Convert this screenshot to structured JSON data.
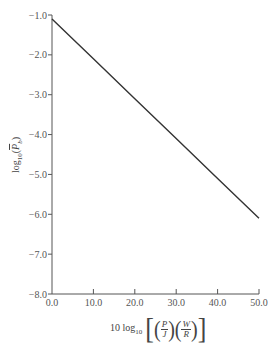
{
  "chart_data": {
    "type": "line",
    "title": "",
    "xlabel": "10 log10 [(P/J)(W/R)]",
    "ylabel": "log10(P̄b)",
    "xlim": [
      0,
      50
    ],
    "ylim": [
      -8,
      -1
    ],
    "grid": false,
    "legend": null,
    "x_ticks": [
      "0.0",
      "10.0",
      "20.0",
      "30.0",
      "40.0",
      "50.0"
    ],
    "y_ticks": [
      "-1.0",
      "-2.0",
      "-3.0",
      "-4.0",
      "-5.0",
      "-6.0",
      "-7.0",
      "-8.0"
    ],
    "series": [
      {
        "name": "log10(P̄b)",
        "x": [
          0,
          10,
          20,
          30,
          40,
          50
        ],
        "values": [
          -1.1,
          -2.1,
          -3.1,
          -4.1,
          -5.1,
          -6.1
        ]
      }
    ],
    "line_color": "#333333"
  },
  "axes": {
    "x_tick_labels": [
      "0.0",
      "10.0",
      "20.0",
      "30.0",
      "40.0",
      "50.0"
    ],
    "y_tick_labels": [
      "-1.0",
      "-2.0",
      "-3.0",
      "-4.0",
      "-5.0",
      "-6.0",
      "-7.0",
      "-8.0"
    ],
    "xlabel_prefix": "10 log",
    "xlabel_sub": "10",
    "xlabel_frac1_num": "P",
    "xlabel_frac1_den": "J",
    "xlabel_frac2_num": "W",
    "xlabel_frac2_den": "R",
    "ylabel_prefix": "log",
    "ylabel_sub": "10",
    "ylabel_var": "P",
    "ylabel_var_sub": "b"
  }
}
